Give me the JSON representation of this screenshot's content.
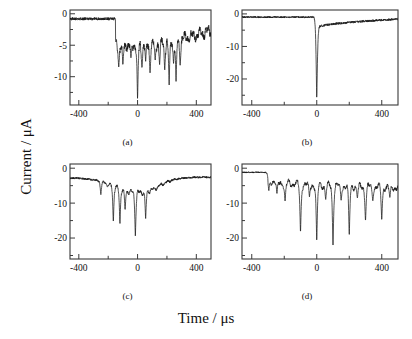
{
  "figure": {
    "xlabel": "Time / μs",
    "ylabel": "Current / μA",
    "background": "#ffffff",
    "line_color": "#1a1a1a",
    "axis_color": "#3a3a3a"
  },
  "chart_data": [
    {
      "type": "line",
      "panel": "a",
      "caption": "(a)",
      "title": "",
      "xlabel": "Time / μs",
      "ylabel": "Current / μA",
      "xlim": [
        -460,
        500
      ],
      "ylim": [
        -14.5,
        0.6
      ],
      "xticks": [
        -400,
        -200,
        0,
        200,
        400
      ],
      "xticklabels": [
        "-400",
        "",
        "0",
        "",
        "400"
      ],
      "yticks": [
        0,
        -5,
        -10
      ],
      "yticklabels": [
        "0",
        "-5",
        "-10"
      ],
      "grid": false,
      "legend": null,
      "description": "Baseline near -0.8 uA until a step at about -150 us, then a noisy plateau near -5 uA with many sharp downward current spikes, recovering toward -2.7 uA by +500 us.",
      "baseline_before": -0.8,
      "step_time": -150,
      "plateau_level": -5.0,
      "recovery_level": -2.7,
      "spikes": [
        {
          "t": -128,
          "depth": -8.5
        },
        {
          "t": -100,
          "depth": -8.2
        },
        {
          "t": -45,
          "depth": -7.0
        },
        {
          "t": 0,
          "depth": -13.6
        },
        {
          "t": 30,
          "depth": -8.6
        },
        {
          "t": 55,
          "depth": -7.6
        },
        {
          "t": 85,
          "depth": -9.4
        },
        {
          "t": 120,
          "depth": -7.4
        },
        {
          "t": 150,
          "depth": -8.1
        },
        {
          "t": 185,
          "depth": -9.0
        },
        {
          "t": 215,
          "depth": -11.4
        },
        {
          "t": 245,
          "depth": -7.9
        },
        {
          "t": 262,
          "depth": -10.8
        },
        {
          "t": 290,
          "depth": -8.2
        }
      ]
    },
    {
      "type": "line",
      "panel": "b",
      "caption": "(b)",
      "title": "",
      "xlabel": "Time / μs",
      "ylabel": "Current / μA",
      "xlim": [
        -460,
        500
      ],
      "ylim": [
        -28,
        1.2
      ],
      "xticks": [
        -400,
        -200,
        0,
        200,
        400
      ],
      "xticklabels": [
        "-400",
        "",
        "0",
        "",
        "400"
      ],
      "yticks": [
        0,
        -10,
        -20
      ],
      "yticklabels": [
        "0",
        "-10",
        "-20"
      ],
      "grid": false,
      "legend": null,
      "description": "Flat noisy baseline near -1 uA, one very deep narrow spike at t = 0 reaching about -26 uA, then a step to about -4 uA recovering slowly back toward -1.5 uA.",
      "baseline_before": -1.0,
      "step_time": 0,
      "plateau_level": -4.2,
      "recovery_level": -1.6,
      "spikes": [
        {
          "t": 0,
          "depth": -26.0
        }
      ]
    },
    {
      "type": "line",
      "panel": "c",
      "caption": "(c)",
      "title": "",
      "xlabel": "Time / μs",
      "ylabel": "Current / μA",
      "xlim": [
        -460,
        500
      ],
      "ylim": [
        -26,
        1.2
      ],
      "xticks": [
        -400,
        -200,
        0,
        200,
        400
      ],
      "xticklabels": [
        "-400",
        "",
        "0",
        "",
        "400"
      ],
      "yticks": [
        0,
        -10,
        -20
      ],
      "yticklabels": [
        "0",
        "-10",
        "-20"
      ],
      "grid": false,
      "legend": null,
      "description": "Slow broad dip from -2.8 uA down to about -7 uA centred near t = 0, with several very deep narrow spikes between -250 and +60 us, recovering to -2.6 uA by +500 us.",
      "baseline_before": -2.8,
      "dip_center": 0,
      "dip_level": -7.0,
      "recovery_level": -2.6,
      "spikes": [
        {
          "t": -250,
          "depth": -7.6
        },
        {
          "t": -205,
          "depth": -5.4
        },
        {
          "t": -165,
          "depth": -15.5
        },
        {
          "t": -120,
          "depth": -16.0
        },
        {
          "t": -85,
          "depth": -12.0
        },
        {
          "t": -15,
          "depth": -19.5
        },
        {
          "t": 55,
          "depth": -14.5
        }
      ]
    },
    {
      "type": "line",
      "panel": "d",
      "caption": "(d)",
      "title": "",
      "xlabel": "Time / μs",
      "ylabel": "Current / μA",
      "xlim": [
        -460,
        500
      ],
      "ylim": [
        -26,
        1.2
      ],
      "xticks": [
        -400,
        -200,
        0,
        200,
        400
      ],
      "xticklabels": [
        "-400",
        "",
        "0",
        "",
        "400"
      ],
      "yticks": [
        0,
        -10,
        -20
      ],
      "yticklabels": [
        "0",
        "-10",
        "-20"
      ],
      "grid": false,
      "legend": null,
      "description": "Baseline near -1.2 uA drifting down past t = -300 us to a noisy level near -5 to -6 uA, with many regularly spaced deep narrow spikes, the deepest reaching about -22 uA.",
      "baseline_before": -1.2,
      "step_time": -300,
      "plateau_level": -5.5,
      "recovery_level": -4.6,
      "spikes": [
        {
          "t": -295,
          "depth": -6.5
        },
        {
          "t": -245,
          "depth": -7.4
        },
        {
          "t": -195,
          "depth": -9.6
        },
        {
          "t": -100,
          "depth": -18.6
        },
        {
          "t": -45,
          "depth": -8.2
        },
        {
          "t": 0,
          "depth": -20.8
        },
        {
          "t": 55,
          "depth": -9.0
        },
        {
          "t": 100,
          "depth": -22.0
        },
        {
          "t": 150,
          "depth": -9.2
        },
        {
          "t": 200,
          "depth": -19.2
        },
        {
          "t": 250,
          "depth": -8.6
        },
        {
          "t": 300,
          "depth": -15.2
        },
        {
          "t": 345,
          "depth": -9.4
        },
        {
          "t": 400,
          "depth": -14.8
        },
        {
          "t": 450,
          "depth": -8.4
        }
      ]
    }
  ]
}
